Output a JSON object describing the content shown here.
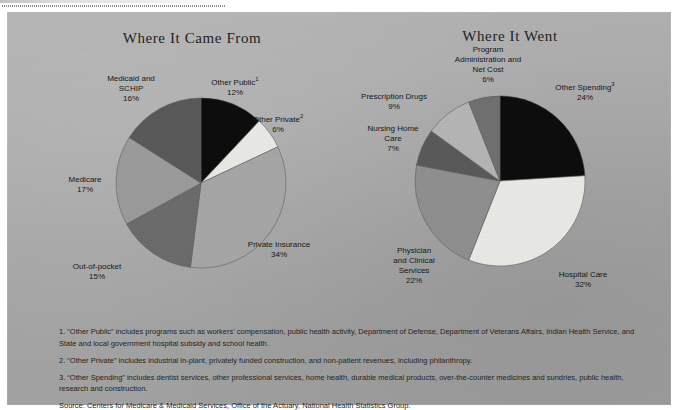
{
  "page": {
    "background_color": "#ffffff",
    "panel_color": "#a9a9a9"
  },
  "charts": {
    "left": {
      "title": "Where It Came From",
      "labels": {
        "other_public": {
          "name": "Other Public",
          "sup": "1",
          "pct": "12%"
        },
        "other_private": {
          "name": "Other Private",
          "sup": "2",
          "pct": "6%"
        },
        "private_insurance": {
          "name": "Private Insurance",
          "sup": "",
          "pct": "34%"
        },
        "out_of_pocket": {
          "name": "Out-of-pocket",
          "sup": "",
          "pct": "15%"
        },
        "medicare": {
          "name": "Medicare",
          "sup": "",
          "pct": "17%"
        },
        "medicaid_schip_l1": {
          "name": "Medicaid and",
          "sup": "",
          "pct": ""
        },
        "medicaid_schip_l2": {
          "name": "SCHIP",
          "sup": "",
          "pct": "16%"
        }
      }
    },
    "right": {
      "title": "Where It Went",
      "labels": {
        "program_admin_l1": {
          "name": "Program",
          "sup": "",
          "pct": ""
        },
        "program_admin_l2": {
          "name": "Administration and",
          "sup": "",
          "pct": ""
        },
        "program_admin_l3": {
          "name": "Net Cost",
          "sup": "",
          "pct": "6%"
        },
        "other_spending": {
          "name": "Other Spending",
          "sup": "3",
          "pct": "24%"
        },
        "hospital_care": {
          "name": "Hospital Care",
          "sup": "",
          "pct": "32%"
        },
        "physician_l1": {
          "name": "Physician",
          "sup": "",
          "pct": ""
        },
        "physician_l2": {
          "name": "and Clinical",
          "sup": "",
          "pct": ""
        },
        "physician_l3": {
          "name": "Services",
          "sup": "",
          "pct": "22%"
        },
        "nursing_home_l1": {
          "name": "Nursing Home",
          "sup": "",
          "pct": ""
        },
        "nursing_home_l2": {
          "name": "Care",
          "sup": "",
          "pct": "7%"
        },
        "prescription": {
          "name": "Prescription Drugs",
          "sup": "",
          "pct": "9%"
        }
      }
    }
  },
  "chart_data": [
    {
      "type": "pie",
      "id": "where-it-came-from",
      "title": "Where It Came From",
      "start_angle_deg": 0,
      "direction": "clockwise",
      "units": "percent",
      "categories": [
        "Other Public",
        "Other Private",
        "Private Insurance",
        "Out-of-pocket",
        "Medicare",
        "Medicaid and SCHIP"
      ],
      "values": [
        12,
        6,
        34,
        15,
        17,
        16
      ],
      "labels": [
        "Other Public¹ 12%",
        "Other Private² 6%",
        "Private Insurance 34%",
        "Out-of-pocket 15%",
        "Medicare 17%",
        "Medicaid and SCHIP 16%"
      ],
      "colors": [
        "#0b0b0b",
        "#e8e8e4",
        "#a5a5a5",
        "#6a6a6a",
        "#9a9a9a",
        "#585858"
      ],
      "legend": "none"
    },
    {
      "type": "pie",
      "id": "where-it-went",
      "title": "Where It Went",
      "start_angle_deg": 0,
      "direction": "clockwise",
      "units": "percent",
      "categories": [
        "Other Spending",
        "Hospital Care",
        "Physician and Clinical Services",
        "Nursing Home Care",
        "Prescription Drugs",
        "Program Administration and Net Cost"
      ],
      "values": [
        24,
        32,
        22,
        7,
        9,
        6
      ],
      "labels": [
        "Other Spending³ 24%",
        "Hospital Care 32%",
        "Physician and Clinical Services 22%",
        "Nursing Home Care 7%",
        "Prescription Drugs 9%",
        "Program Administration and Net Cost 6%"
      ],
      "colors": [
        "#0b0b0b",
        "#e8e8e4",
        "#8e8e8e",
        "#585858",
        "#b4b4b4",
        "#6f6f6f"
      ],
      "legend": "none"
    }
  ],
  "footnotes": [
    "1. “Other Public” includes programs such as workers’ compensation, public health activity, Department of Defense, Department of Veterans Affairs, Indian Health Service, and State and local government hospital subsidy and school health.",
    "2. “Other Private” includes industrial in-plant, privately funded construction, and non-patient revenues, including philanthropy.",
    "3. “Other Spending” includes dentist services, other professional services, home health, durable medical products, over-the-counter medicines and sundries, public health, research and construction."
  ],
  "source": "Source: Centers for Medicare & Medicaid Services, Office of the Actuary, National Health Statistics Group."
}
